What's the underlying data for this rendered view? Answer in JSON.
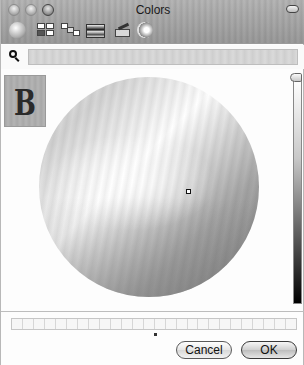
{
  "window": {
    "title": "Colors"
  },
  "toolbar": {
    "tools": [
      {
        "name": "color-wheel",
        "icon": "color-wheel-icon"
      },
      {
        "name": "color-sliders",
        "icon": "sliders-icon"
      },
      {
        "name": "color-palettes",
        "icon": "palettes-icon"
      },
      {
        "name": "image-palettes",
        "icon": "spectrum-icon"
      },
      {
        "name": "crayons",
        "icon": "crayons-icon"
      },
      {
        "name": "magnifier",
        "icon": "magnifier-icon"
      }
    ]
  },
  "search": {
    "value": "",
    "placeholder": ""
  },
  "preview": {
    "letter": "B"
  },
  "wheel": {
    "cursor": {
      "x": 186,
      "y": 190
    }
  },
  "brightness": {
    "value_percent": 100
  },
  "swatches": {
    "count": 26
  },
  "buttons": {
    "cancel": "Cancel",
    "ok": "OK"
  }
}
